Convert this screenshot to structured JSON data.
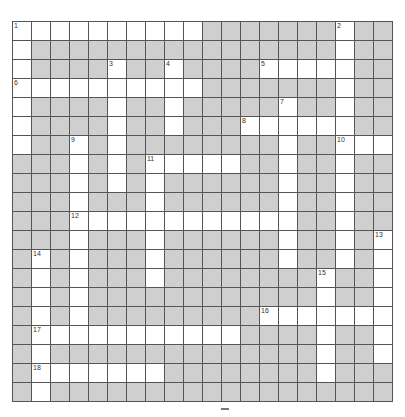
{
  "puzzle": {
    "rows": 20,
    "cols": 20,
    "block_color": "#cfcfcf",
    "open_color": "#ffffff",
    "grid": [
      "..........#######.##",
      ".################.##",
      ".####.##.####.....##",
      "..........#######.##",
      ".####.##.#####.##.##",
      ".####.##.###......##",
      ".##.#.########.##...",
      "###.#.#.....##.##.##",
      "###.#.#.######.##.##",
      "###.###.######.##.##",
      "###............##.##",
      "###.###.######.##.#.",
      "#.#.###.######.##.#.",
      "#.#.###.########.##.",
      "#.#.############.##.",
      "#.#.#########.......",
      "#...........####.##.",
      "#.##############.##.",
      "#.......########.###",
      "#.##################"
    ],
    "numbers": [
      {
        "n": "1",
        "r": 0,
        "c": 0
      },
      {
        "n": "2",
        "r": 0,
        "c": 17
      },
      {
        "n": "3",
        "r": 2,
        "c": 5
      },
      {
        "n": "4",
        "r": 2,
        "c": 8
      },
      {
        "n": "5",
        "r": 2,
        "c": 13
      },
      {
        "n": "6",
        "r": 3,
        "c": 0
      },
      {
        "n": "7",
        "r": 4,
        "c": 14
      },
      {
        "n": "8",
        "r": 5,
        "c": 12
      },
      {
        "n": "9",
        "r": 6,
        "c": 3
      },
      {
        "n": "10",
        "r": 6,
        "c": 17
      },
      {
        "n": "11",
        "r": 7,
        "c": 7
      },
      {
        "n": "12",
        "r": 10,
        "c": 3
      },
      {
        "n": "13",
        "r": 11,
        "c": 19
      },
      {
        "n": "14",
        "r": 12,
        "c": 1
      },
      {
        "n": "15",
        "r": 13,
        "c": 16
      },
      {
        "n": "16",
        "r": 15,
        "c": 13
      },
      {
        "n": "17",
        "r": 16,
        "c": 1
      },
      {
        "n": "18",
        "r": 18,
        "c": 1
      }
    ]
  }
}
